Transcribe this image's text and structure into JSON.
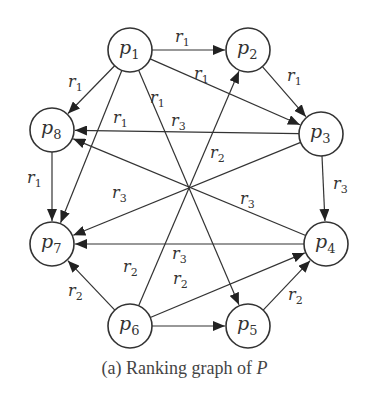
{
  "caption": {
    "prefix": "(a) Ranking graph of ",
    "variable": "P"
  },
  "nodes": [
    {
      "id": "p1",
      "base": "p",
      "sub": "1",
      "x": 130,
      "y": 50
    },
    {
      "id": "p2",
      "base": "p",
      "sub": "2",
      "x": 248,
      "y": 50
    },
    {
      "id": "p3",
      "base": "p",
      "sub": "3",
      "x": 321,
      "y": 134
    },
    {
      "id": "p4",
      "base": "p",
      "sub": "4",
      "x": 326,
      "y": 244
    },
    {
      "id": "p5",
      "base": "p",
      "sub": "5",
      "x": 248,
      "y": 326
    },
    {
      "id": "p6",
      "base": "p",
      "sub": "6",
      "x": 130,
      "y": 326
    },
    {
      "id": "p7",
      "base": "p",
      "sub": "7",
      "x": 52,
      "y": 244
    },
    {
      "id": "p8",
      "base": "p",
      "sub": "8",
      "x": 52,
      "y": 130
    }
  ],
  "edges": [
    {
      "from": "p1",
      "to": "p2",
      "label": "r1"
    },
    {
      "from": "p1",
      "to": "p8",
      "label": "r1"
    },
    {
      "from": "p1",
      "to": "p3",
      "label": "r1"
    },
    {
      "from": "p1",
      "to": "p7",
      "label": "r1"
    },
    {
      "from": "p1",
      "to": "p5",
      "label": "r1"
    },
    {
      "from": "p2",
      "to": "p3",
      "label": "r1"
    },
    {
      "from": "p8",
      "to": "p7",
      "label": "r1"
    },
    {
      "from": "p3",
      "to": "p8",
      "label": "r3"
    },
    {
      "from": "p3",
      "to": "p7",
      "label": "r3"
    },
    {
      "from": "p3",
      "to": "p4",
      "label": "r3"
    },
    {
      "from": "p4",
      "to": "p8",
      "label": "r3"
    },
    {
      "from": "p4",
      "to": "p7",
      "label": "r3"
    },
    {
      "from": "p6",
      "to": "p7",
      "label": "r2"
    },
    {
      "from": "p6",
      "to": "p2",
      "label": "r2"
    },
    {
      "from": "p6",
      "to": "p4",
      "label": "r2"
    },
    {
      "from": "p6",
      "to": "p5",
      "label": ""
    },
    {
      "from": "p5",
      "to": "p4",
      "label": "r2"
    }
  ],
  "edge_labels": [
    {
      "text": "r",
      "sub": "1",
      "x": 175,
      "y": 42
    },
    {
      "text": "r",
      "sub": "1",
      "x": 68,
      "y": 87
    },
    {
      "text": "r",
      "sub": "1",
      "x": 194,
      "y": 79
    },
    {
      "text": "r",
      "sub": "1",
      "x": 113,
      "y": 123
    },
    {
      "text": "r",
      "sub": "1",
      "x": 150,
      "y": 103
    },
    {
      "text": "r",
      "sub": "1",
      "x": 287,
      "y": 81
    },
    {
      "text": "r",
      "sub": "1",
      "x": 27,
      "y": 183
    },
    {
      "text": "r",
      "sub": "3",
      "x": 171,
      "y": 126
    },
    {
      "text": "r",
      "sub": "2",
      "x": 210,
      "y": 158
    },
    {
      "text": "r",
      "sub": "3",
      "x": 333,
      "y": 189
    },
    {
      "text": "r",
      "sub": "3",
      "x": 112,
      "y": 198
    },
    {
      "text": "r",
      "sub": "3",
      "x": 240,
      "y": 204
    },
    {
      "text": "r",
      "sub": "3",
      "x": 172,
      "y": 259
    },
    {
      "text": "r",
      "sub": "2",
      "x": 123,
      "y": 272
    },
    {
      "text": "r",
      "sub": "2",
      "x": 173,
      "y": 284
    },
    {
      "text": "r",
      "sub": "2",
      "x": 68,
      "y": 296
    },
    {
      "text": "r",
      "sub": "2",
      "x": 288,
      "y": 300
    }
  ],
  "colors": {
    "stroke": "#333333",
    "background": "#ffffff"
  }
}
